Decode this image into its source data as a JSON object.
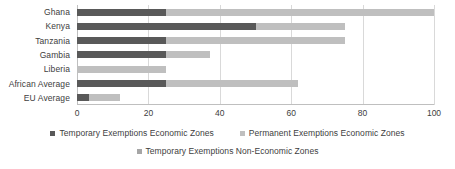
{
  "chart_data": {
    "type": "bar",
    "orientation": "horizontal",
    "stacked": true,
    "title": "",
    "subtitle": "",
    "xlabel": "",
    "ylabel": "",
    "xlim": [
      0,
      100
    ],
    "grid": true,
    "legend_position": "bottom",
    "categories": [
      "Ghana",
      "Kenya",
      "Tanzania",
      "Gambia",
      "Liberia",
      "African Average",
      "EU Average"
    ],
    "xticks": [
      0,
      20,
      40,
      60,
      80,
      100
    ],
    "xtick_labels": [
      "0",
      "20",
      "40",
      "60",
      "80",
      "100"
    ],
    "series": [
      {
        "name": "Temporary Exemptions Economic Zones",
        "color": "#595959",
        "values": [
          25,
          50,
          25,
          25,
          0,
          25,
          3.5
        ]
      },
      {
        "name": "Permanent Exemptions Economic Zones",
        "color": "#bfbfbf",
        "values": [
          75,
          25,
          50,
          12.3,
          25,
          37,
          8.5
        ]
      },
      {
        "name": "Temporary Exemptions Non-Economic Zones",
        "color": "#a6a6a6",
        "values": [
          0,
          0,
          0,
          0,
          0,
          0,
          0
        ]
      }
    ],
    "totals": [
      100,
      75,
      75,
      37.3,
      25,
      62,
      12
    ]
  },
  "legend": {
    "items": [
      {
        "label": "Temporary Exemptions Economic Zones",
        "color": "#595959"
      },
      {
        "label": "Permanent Exemptions Economic Zones",
        "color": "#bfbfbf"
      },
      {
        "label": "Temporary Exemptions Non-Economic Zones",
        "color": "#a6a6a6"
      }
    ]
  }
}
